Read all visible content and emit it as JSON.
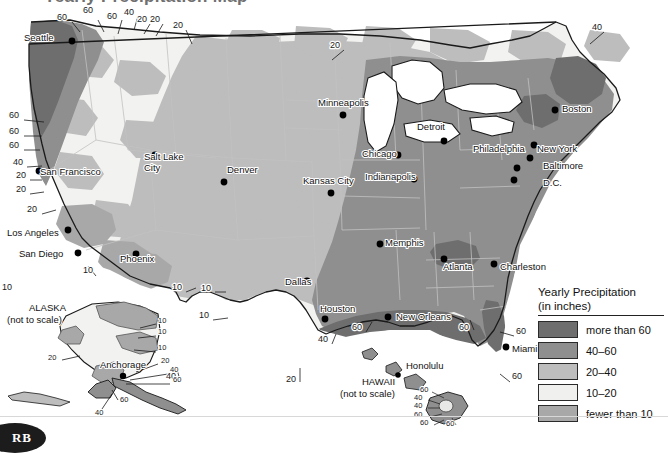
{
  "page": {
    "title_partial": "Yearly Precipitation Map",
    "logo_text": "RB"
  },
  "legend": {
    "title_line1": "Yearly Precipitation",
    "title_line2": "(in inches)",
    "items": [
      {
        "label": "more than 60",
        "color": "#6e6e6e"
      },
      {
        "label": "40–60",
        "color": "#8f8f8f"
      },
      {
        "label": "20–40",
        "color": "#bdbdbd"
      },
      {
        "label": "10–20",
        "color": "#f0f0ee"
      },
      {
        "label": "fewer than 10",
        "color": "#a8a8a8"
      }
    ]
  },
  "map": {
    "ocean_color": "#ffffff",
    "outline_color": "#1a1a1a",
    "state_border_color": "#b4b4b4",
    "cities": [
      {
        "name": "Seattle",
        "x": 24,
        "y": 41,
        "dx": 0,
        "dy": 0,
        "anchor": "start",
        "dot_x": 72,
        "dot_y": 41
      },
      {
        "name": "San Francisco",
        "x": 40,
        "y": 175,
        "anchor": "start",
        "dot_x": 39,
        "dot_y": 171
      },
      {
        "name": "Los Angeles",
        "x": 7,
        "y": 236,
        "anchor": "start",
        "dot_x": 68,
        "dot_y": 230
      },
      {
        "name": "San Diego",
        "x": 19,
        "y": 257,
        "anchor": "start",
        "dot_x": 78,
        "dot_y": 253
      },
      {
        "name": "Phoenix",
        "x": 120,
        "y": 262,
        "anchor": "start",
        "dot_x": 136,
        "dot_y": 254
      },
      {
        "name": "Salt Lake\nCity",
        "x": 144,
        "y": 160,
        "anchor": "start",
        "dot_x": 155,
        "dot_y": 155
      },
      {
        "name": "Denver",
        "x": 227,
        "y": 173,
        "anchor": "start",
        "dot_x": 224,
        "dot_y": 182
      },
      {
        "name": "Minneapolis",
        "x": 318,
        "y": 106,
        "anchor": "start",
        "dot_x": 343,
        "dot_y": 115
      },
      {
        "name": "Kansas City",
        "x": 303,
        "y": 184,
        "anchor": "start",
        "dot_x": 331,
        "dot_y": 193
      },
      {
        "name": "Chicago",
        "x": 362,
        "y": 157,
        "anchor": "start",
        "dot_x": 398,
        "dot_y": 155
      },
      {
        "name": "Detroit",
        "x": 417,
        "y": 130,
        "anchor": "start",
        "dot_x": 444,
        "dot_y": 141
      },
      {
        "name": "Indianapolis",
        "x": 365,
        "y": 180,
        "anchor": "start",
        "dot_x": 414,
        "dot_y": 179
      },
      {
        "name": "Memphis",
        "x": 385,
        "y": 246,
        "anchor": "start",
        "dot_x": 380,
        "dot_y": 244
      },
      {
        "name": "Atlanta",
        "x": 443,
        "y": 270,
        "anchor": "start",
        "dot_x": 444,
        "dot_y": 259
      },
      {
        "name": "Dallas",
        "x": 285,
        "y": 285,
        "anchor": "start",
        "dot_x": 307,
        "dot_y": 281
      },
      {
        "name": "Houston",
        "x": 320,
        "y": 312,
        "anchor": "start",
        "dot_x": 325,
        "dot_y": 319
      },
      {
        "name": "New Orleans",
        "x": 396,
        "y": 320,
        "anchor": "start",
        "dot_x": 388,
        "dot_y": 317
      },
      {
        "name": "Charleston",
        "x": 500,
        "y": 270,
        "anchor": "start",
        "dot_x": 494,
        "dot_y": 264
      },
      {
        "name": "Philadelphia",
        "x": 473,
        "y": 152,
        "anchor": "start",
        "dot_x": 530,
        "dot_y": 158
      },
      {
        "name": "New York",
        "x": 537,
        "y": 152,
        "anchor": "start",
        "dot_x": 534,
        "dot_y": 145
      },
      {
        "name": "Baltimore",
        "x": 543,
        "y": 169,
        "anchor": "start",
        "dot_x": 517,
        "dot_y": 168
      },
      {
        "name": "D.C.",
        "x": 543,
        "y": 186,
        "anchor": "start",
        "dot_x": 514,
        "dot_y": 180
      },
      {
        "name": "Boston",
        "x": 562,
        "y": 112,
        "anchor": "start",
        "dot_x": 555,
        "dot_y": 110
      },
      {
        "name": "Miami",
        "x": 512,
        "y": 352,
        "anchor": "start",
        "dot_x": 506,
        "dot_y": 347
      }
    ],
    "contour_labels": [
      {
        "value": "60",
        "x": 57,
        "y": 20
      },
      {
        "value": "60",
        "x": 83,
        "y": 13
      },
      {
        "value": "60",
        "x": 107,
        "y": 19
      },
      {
        "value": "40",
        "x": 124,
        "y": 15
      },
      {
        "value": "20",
        "x": 137,
        "y": 22
      },
      {
        "value": "20",
        "x": 150,
        "y": 22
      },
      {
        "value": "20",
        "x": 173,
        "y": 28
      },
      {
        "value": "20",
        "x": 330,
        "y": 48
      },
      {
        "value": "40",
        "x": 592,
        "y": 30
      },
      {
        "value": "60",
        "x": 9,
        "y": 118
      },
      {
        "value": "60",
        "x": 9,
        "y": 134
      },
      {
        "value": "60",
        "x": 9,
        "y": 148
      },
      {
        "value": "40",
        "x": 13,
        "y": 165
      },
      {
        "value": "20",
        "x": 16,
        "y": 178
      },
      {
        "value": "20",
        "x": 16,
        "y": 192
      },
      {
        "value": "20",
        "x": 27,
        "y": 212
      },
      {
        "value": "10",
        "x": 83,
        "y": 273
      },
      {
        "value": "10",
        "x": 2,
        "y": 290
      },
      {
        "value": "10",
        "x": 172,
        "y": 290
      },
      {
        "value": "10",
        "x": 201,
        "y": 291
      },
      {
        "value": "10",
        "x": 199,
        "y": 318
      },
      {
        "value": "20",
        "x": 286,
        "y": 382
      },
      {
        "value": "40",
        "x": 166,
        "y": 379
      },
      {
        "value": "40",
        "x": 318,
        "y": 342
      },
      {
        "value": "60",
        "x": 352,
        "y": 330
      },
      {
        "value": "60",
        "x": 459,
        "y": 330
      },
      {
        "value": "60",
        "x": 516,
        "y": 334
      },
      {
        "value": "60",
        "x": 512,
        "y": 379
      }
    ],
    "alaska": {
      "title_line1": "ALASKA",
      "title_line2": "(not to scale)",
      "title_x": 29,
      "title_y": 311,
      "city": {
        "name": "Anchorage",
        "x": 100,
        "y": 368,
        "dot_x": 123,
        "dot_y": 376
      },
      "contour_labels": [
        {
          "value": "10",
          "x": 158,
          "y": 323
        },
        {
          "value": "10",
          "x": 158,
          "y": 334
        },
        {
          "value": "10",
          "x": 158,
          "y": 350
        },
        {
          "value": "20",
          "x": 48,
          "y": 360
        },
        {
          "value": "20",
          "x": 161,
          "y": 363
        },
        {
          "value": "40",
          "x": 170,
          "y": 372
        },
        {
          "value": "60",
          "x": 173,
          "y": 382
        },
        {
          "value": "60",
          "x": 120,
          "y": 402
        },
        {
          "value": "40",
          "x": 95,
          "y": 415
        }
      ]
    },
    "hawaii": {
      "title_line1": "HAWAII",
      "title_line2": "(not to scale)",
      "title_x": 362,
      "title_y": 385,
      "city": {
        "name": "Honolulu",
        "x": 406,
        "y": 369,
        "dot_x": 398,
        "dot_y": 375
      },
      "contour_labels": [
        {
          "value": "60",
          "x": 420,
          "y": 392
        },
        {
          "value": "40",
          "x": 414,
          "y": 400
        },
        {
          "value": "40",
          "x": 414,
          "y": 408
        },
        {
          "value": "60",
          "x": 414,
          "y": 417
        },
        {
          "value": "60",
          "x": 420,
          "y": 425
        },
        {
          "value": "60",
          "x": 446,
          "y": 426
        }
      ]
    }
  }
}
